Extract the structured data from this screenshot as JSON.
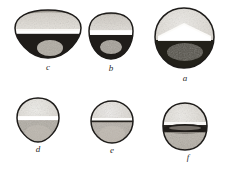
{
  "figure": {
    "kind": "scientific-illustration-plate",
    "medium": "stipple-engraving",
    "background_color": "#ffffff",
    "ink_color": "#2b2b2b",
    "specimen_count": 6,
    "rows": 2,
    "columns": 3
  },
  "palette": {
    "background": "#ffffff",
    "outline_dark": "#1e1c1a",
    "body_light": "#e3e0da",
    "body_mid": "#b2ada4",
    "body_shade": "#8c867c",
    "band_dark": "#3a3531",
    "furrow_white": "#fbfaf8",
    "label_ink": "#2b2b2b",
    "stipple": "#55504a"
  },
  "specimens": [
    {
      "id": "specimen-c",
      "label": "c",
      "row": 1,
      "column": 1,
      "outline": "wide-dome",
      "description": "broad dome-shaped grain, flattened wide top arc, dark trapezoidal lower half",
      "has_equatorial_furrow": true,
      "furrow_tone": "white",
      "lower_half_tone": "dark",
      "box": {
        "x": 12,
        "y": 8,
        "width": 72,
        "height": 52
      },
      "label_position": {
        "x": 41,
        "y": 62
      }
    },
    {
      "id": "specimen-b",
      "label": "b",
      "row": 1,
      "column": 2,
      "outline": "rounded-bell",
      "description": "rounded bell-shaped grain, light stippled upper cap, dark lower band",
      "has_equatorial_furrow": true,
      "furrow_tone": "white",
      "lower_half_tone": "dark",
      "box": {
        "x": 87,
        "y": 11,
        "width": 48,
        "height": 50
      },
      "label_position": {
        "x": 104,
        "y": 63
      }
    },
    {
      "id": "specimen-a",
      "label": "a",
      "row": 1,
      "column": 3,
      "outline": "rounded-rhombic",
      "description": "largest grain, rounded-square outline, broad white triangular wedge with dark band beneath",
      "has_equatorial_furrow": true,
      "furrow_tone": "white",
      "lower_half_tone": "dark",
      "box": {
        "x": 152,
        "y": 6,
        "width": 65,
        "height": 65
      },
      "label_position": {
        "x": 178,
        "y": 73
      }
    },
    {
      "id": "specimen-d",
      "label": "d",
      "row": 2,
      "column": 1,
      "outline": "rounded-top-tapered-base",
      "description": "round-topped grain tapering to a blunt point, bright white equatorial band",
      "has_equatorial_furrow": true,
      "furrow_tone": "white",
      "lower_half_tone": "mid",
      "box": {
        "x": 14,
        "y": 96,
        "width": 48,
        "height": 48
      },
      "label_position": {
        "x": 31,
        "y": 144
      }
    },
    {
      "id": "specimen-e",
      "label": "e",
      "row": 2,
      "column": 2,
      "outline": "rounded-angular",
      "description": "compact angular-round grain with a narrow dark equatorial slit",
      "has_equatorial_furrow": true,
      "furrow_tone": "dark-line",
      "lower_half_tone": "mid",
      "box": {
        "x": 89,
        "y": 99,
        "width": 46,
        "height": 46
      },
      "label_position": {
        "x": 105,
        "y": 145
      }
    },
    {
      "id": "specimen-f",
      "label": "f",
      "row": 2,
      "column": 3,
      "outline": "rounded-ovoid",
      "description": "ovoid grain with a broad dark horizontal band set below the equator",
      "has_equatorial_furrow": true,
      "furrow_tone": "dark",
      "lower_half_tone": "mid",
      "box": {
        "x": 160,
        "y": 101,
        "width": 50,
        "height": 51
      },
      "label_position": {
        "x": 181,
        "y": 152
      }
    }
  ]
}
